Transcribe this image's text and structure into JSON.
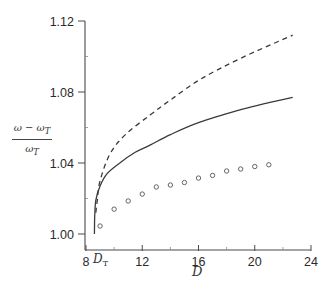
{
  "chart_data": {
    "type": "line",
    "title": "",
    "xlabel": "D",
    "ylabel": "(ω − ω_T) / ω_T",
    "ylabel_parts": {
      "numerator": "ω − ω",
      "numerator_sub": "T",
      "denominator": "ω",
      "denominator_sub": "T"
    },
    "xlim": [
      8,
      24
    ],
    "ylim": [
      0.995,
      1.12
    ],
    "x_ticks": [
      8,
      12,
      16,
      20,
      24
    ],
    "x_tick_labels": [
      "8",
      "12",
      "16",
      "20",
      "24"
    ],
    "x_minor_ticks": [
      10,
      14,
      18,
      22
    ],
    "y_ticks": [
      1.0,
      1.04,
      1.08,
      1.12
    ],
    "y_tick_labels": [
      "1.00",
      "1.04",
      "1.08",
      "1.12"
    ],
    "y_minor_ticks": [
      1.02,
      1.06,
      1.1
    ],
    "annotations": [
      {
        "text": "D",
        "subscript": "T",
        "x": 8.6,
        "position": "below x-axis"
      }
    ],
    "grid": false,
    "legend": null,
    "series": [
      {
        "name": "solid",
        "style": "solid",
        "x": [
          8.6,
          8.62,
          8.7,
          9.0,
          9.5,
          10.4,
          11.5,
          12.55,
          14.0,
          16.1,
          19.0,
          21.0,
          22.7
        ],
        "y": [
          1.0,
          1.01,
          1.019,
          1.027,
          1.034,
          1.04,
          1.046,
          1.05,
          1.056,
          1.063,
          1.07,
          1.074,
          1.077
        ]
      },
      {
        "name": "dashed",
        "style": "dashed",
        "x": [
          8.7,
          8.8,
          9.0,
          9.7,
          10.8,
          12.55,
          14.0,
          16.1,
          19.0,
          22.7
        ],
        "y": [
          1.012,
          1.019,
          1.03,
          1.045,
          1.056,
          1.067,
          1.0755,
          1.087,
          1.099,
          1.112
        ]
      },
      {
        "name": "circles",
        "style": "markers",
        "marker": "open-circle",
        "x": [
          9,
          10,
          11,
          12,
          13,
          14,
          15,
          16,
          17,
          18,
          19,
          20,
          21
        ],
        "y": [
          1.0045,
          1.014,
          1.0186,
          1.0225,
          1.0265,
          1.0276,
          1.029,
          1.0315,
          1.033,
          1.0355,
          1.0366,
          1.038,
          1.039
        ]
      }
    ]
  },
  "labels": {
    "x_axis": "D",
    "dt_main": "D",
    "dt_sub": "T",
    "y_num": "ω − ω",
    "y_num_sub": "T",
    "y_den": "ω",
    "y_den_sub": "T"
  },
  "colors": {
    "line": "#3a3a3a",
    "axis": "#4a4a4a",
    "marker": "#555555"
  }
}
